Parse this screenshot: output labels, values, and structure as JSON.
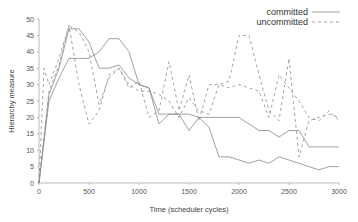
{
  "chart_data": {
    "type": "line",
    "title": "",
    "xlabel": "Time (scheduler cycles)",
    "ylabel": "Hierarchy measure",
    "xlim": [
      0,
      3000
    ],
    "ylim": [
      0,
      50
    ],
    "xticks": [
      0,
      500,
      1000,
      1500,
      2000,
      2500,
      3000
    ],
    "yticks": [
      0,
      5,
      10,
      15,
      20,
      25,
      30,
      35,
      40,
      45,
      50
    ],
    "grid": false,
    "legend_position": "top-right",
    "legend": [
      "committed",
      "uncommitted"
    ],
    "series": [
      {
        "name": "committed",
        "style": "solid",
        "x": [
          0,
          100,
          200,
          300,
          400,
          500,
          600,
          700,
          800,
          900,
          1000,
          1100,
          1200,
          1300,
          1400,
          1500,
          1600,
          1700,
          1800,
          1900,
          2000,
          2100,
          2200,
          2300,
          2400,
          2500,
          2600,
          2700,
          2800,
          2900,
          3000
        ],
        "y": [
          0,
          27,
          35,
          47,
          47,
          43,
          35,
          35,
          36,
          32,
          30,
          29,
          18,
          21,
          21,
          21,
          20,
          20,
          20,
          20,
          20,
          18,
          16,
          16,
          14,
          16,
          16,
          11,
          11,
          11,
          11
        ]
      },
      {
        "name": "committed",
        "style": "solid",
        "x": [
          0,
          100,
          200,
          300,
          400,
          500,
          600,
          700,
          800,
          900,
          1000,
          1100,
          1200,
          1300,
          1400,
          1500,
          1600,
          1700,
          1800,
          1900,
          2000,
          2100,
          2200,
          2300,
          2400,
          2500,
          2600,
          2700,
          2800,
          2900,
          3000
        ],
        "y": [
          0,
          25,
          32,
          38,
          38,
          38,
          40,
          44,
          44,
          40,
          30,
          29,
          21,
          21,
          21,
          16,
          20,
          17,
          8,
          8,
          7,
          6,
          7,
          6,
          8,
          7,
          6,
          5,
          4,
          5,
          5
        ]
      },
      {
        "name": "uncommitted",
        "style": "dashed",
        "x": [
          0,
          50,
          100,
          200,
          300,
          400,
          500,
          600,
          700,
          800,
          900,
          1000,
          1100,
          1200,
          1300,
          1400,
          1500,
          1600,
          1700,
          1800,
          1900,
          2000,
          2100,
          2200,
          2300,
          2400,
          2500,
          2600,
          2700,
          2800,
          2900,
          3000
        ],
        "y": [
          0,
          35,
          30,
          38,
          48,
          30,
          18,
          22,
          33,
          35,
          29,
          31,
          20,
          22,
          37,
          22,
          33,
          19,
          30,
          30,
          31,
          45,
          45,
          33,
          22,
          19,
          38,
          8,
          19,
          20,
          21,
          20
        ]
      },
      {
        "name": "uncommitted",
        "style": "dashed",
        "x": [
          0,
          100,
          200,
          300,
          400,
          500,
          600,
          700,
          800,
          900,
          1000,
          1100,
          1200,
          1300,
          1400,
          1500,
          1600,
          1700,
          1800,
          1900,
          2000,
          2100,
          2200,
          2300,
          2400,
          2500,
          2600,
          2700,
          2800,
          2900,
          3000
        ],
        "y": [
          0,
          28,
          36,
          48,
          46,
          40,
          24,
          32,
          35,
          30,
          28,
          28,
          27,
          25,
          20,
          26,
          22,
          21,
          30,
          29,
          30,
          29,
          28,
          20,
          33,
          29,
          25,
          20,
          19,
          22,
          19
        ]
      }
    ]
  },
  "axes": {
    "xlabel": "Time (scheduler cycles)",
    "ylabel": "Hierarchy measure",
    "xtick_labels": [
      "0",
      "500",
      "1000",
      "1500",
      "2000",
      "2500",
      "3000"
    ],
    "ytick_labels": [
      "0",
      "5",
      "10",
      "15",
      "20",
      "25",
      "30",
      "35",
      "40",
      "45",
      "50"
    ]
  },
  "legend": {
    "items": [
      {
        "label": "committed",
        "style": "solid"
      },
      {
        "label": "uncommitted",
        "style": "dashed"
      }
    ]
  },
  "colors": {
    "line": "#8a8a8a",
    "axis": "#aaaaaa",
    "text": "#444444"
  }
}
